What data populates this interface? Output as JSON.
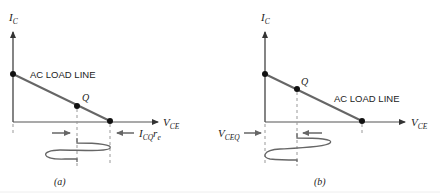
{
  "figure": {
    "panels": [
      {
        "id": "a",
        "caption": "(a)",
        "y_axis_label": "I",
        "y_axis_sub": "C",
        "x_axis_label": "V",
        "x_axis_sub": "CE",
        "load_line_label": "AC LOAD LINE",
        "q_label": "Q",
        "side_annotation_main": "I",
        "side_annotation_sub": "CQ",
        "side_annotation_r": "r",
        "side_annotation_r_sub": "e"
      },
      {
        "id": "b",
        "caption": "(b)",
        "y_axis_label": "I",
        "y_axis_sub": "C",
        "x_axis_label": "V",
        "x_axis_sub": "CE",
        "load_line_label": "AC LOAD LINE",
        "q_label": "Q",
        "side_annotation_main": "V",
        "side_annotation_sub": "CEQ"
      }
    ],
    "colors": {
      "line": "#555555",
      "axis": "#333333",
      "point": "#111111",
      "dash": "#888888"
    }
  }
}
